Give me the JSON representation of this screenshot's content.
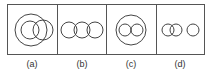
{
  "figure": {
    "stroke_color": "#444444",
    "panels": [
      {
        "id": "a",
        "label": "(a)",
        "description": "Large circle containing a smaller circle, with a third circle overlapping both"
      },
      {
        "id": "b",
        "label": "(b)",
        "description": "Three circles in a row, each overlapping its neighbor"
      },
      {
        "id": "c",
        "label": "(c)",
        "description": "Large circle containing two separate small circles"
      },
      {
        "id": "d",
        "label": "(d)",
        "description": "Two overlapping circles and one separate circle"
      }
    ]
  }
}
